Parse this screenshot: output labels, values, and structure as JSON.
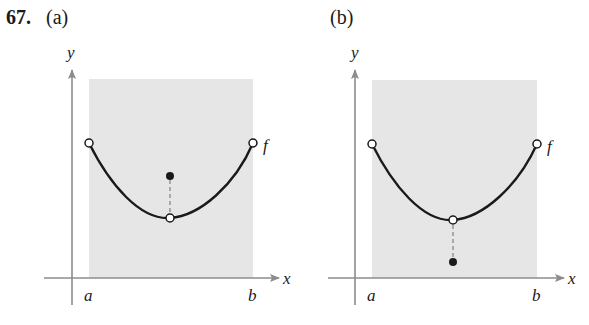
{
  "problem": {
    "number": "67.",
    "parts": [
      {
        "label": "(a)",
        "axis_labels": {
          "x": "x",
          "y": "y"
        },
        "interval_labels": {
          "left": "a",
          "right": "b"
        },
        "function_label": "f",
        "description": "Parabola-like curve on open interval (a, b) with open endpoints; at the minimum the curve point is an open circle and the function value is a filled dot above it."
      },
      {
        "label": "(b)",
        "axis_labels": {
          "x": "x",
          "y": "y"
        },
        "interval_labels": {
          "left": "a",
          "right": "b"
        },
        "function_label": "f",
        "description": "Parabola-like curve on open interval (a, b) with open endpoints; at the minimum the curve point is an open circle and the function value is a filled dot below it."
      }
    ]
  },
  "colors": {
    "shade": "#e6e6e6",
    "axis": "#8c8c8c",
    "curve": "#1a1a1a",
    "text": "#1a1a1a"
  }
}
